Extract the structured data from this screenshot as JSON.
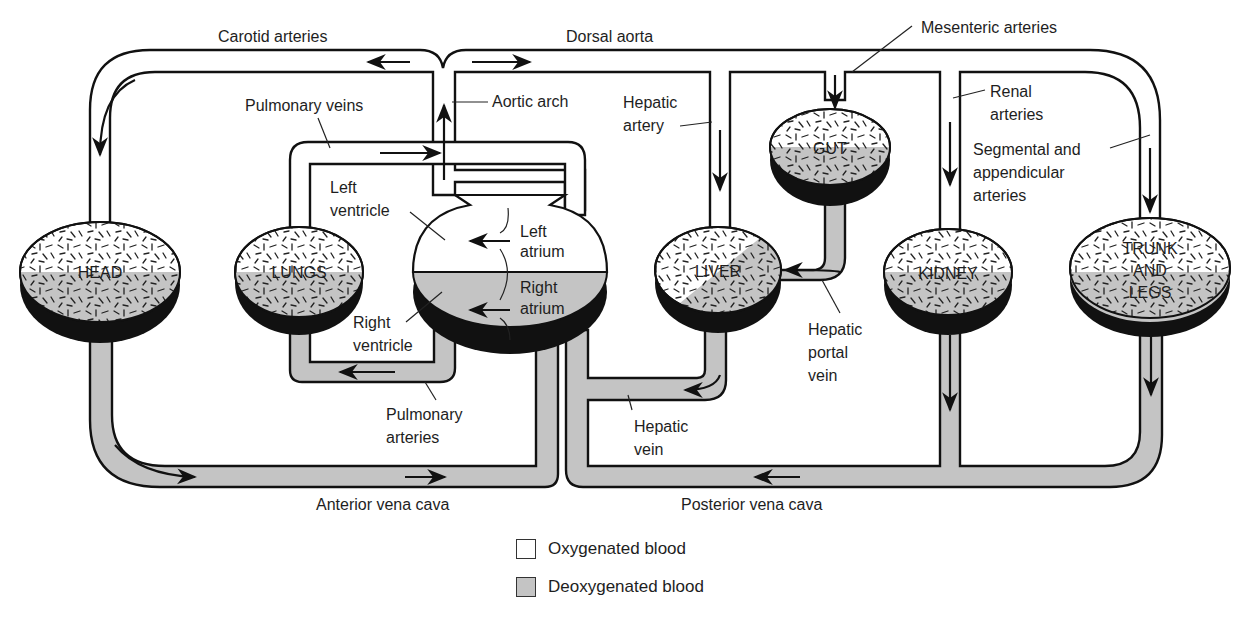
{
  "diagram": {
    "colors": {
      "oxygenated": "#ffffff",
      "deoxygenated": "#c4c4c4",
      "outline": "#111111",
      "shadow": "#111111"
    },
    "vessel_labels": {
      "carotid_arteries": "Carotid arteries",
      "dorsal_aorta": "Dorsal aorta",
      "mesenteric_arteries": "Mesenteric arteries",
      "pulmonary_veins": "Pulmonary veins",
      "aortic_arch": "Aortic arch",
      "hepatic_artery_1": "Hepatic",
      "hepatic_artery_2": "artery",
      "renal_arteries_1": "Renal",
      "renal_arteries_2": "arteries",
      "segmental_1": "Segmental and",
      "segmental_2": "appendicular",
      "segmental_3": "arteries",
      "hepatic_portal_1": "Hepatic",
      "hepatic_portal_2": "portal",
      "hepatic_portal_3": "vein",
      "pulmonary_arteries_1": "Pulmonary",
      "pulmonary_arteries_2": "arteries",
      "hepatic_vein_1": "Hepatic",
      "hepatic_vein_2": "vein",
      "anterior_vena_cava": "Anterior vena cava",
      "posterior_vena_cava": "Posterior vena cava"
    },
    "heart_labels": {
      "left_ventricle_1": "Left",
      "left_ventricle_2": "ventricle",
      "left_atrium_1": "Left",
      "left_atrium_2": "atrium",
      "right_atrium_1": "Right",
      "right_atrium_2": "atrium",
      "right_ventricle_1": "Right",
      "right_ventricle_2": "ventricle"
    },
    "organs": {
      "head": "HEAD",
      "lungs": "LUNGS",
      "gut": "GUT",
      "liver": "LIVER",
      "kidney": "KIDNEY",
      "trunk_1": "TRUNK",
      "trunk_2": "AND",
      "trunk_3": "LEGS"
    }
  },
  "legend": {
    "items": [
      {
        "label": "Oxygenated blood",
        "color": "#ffffff"
      },
      {
        "label": "Deoxygenated blood",
        "color": "#c4c4c4"
      }
    ]
  }
}
